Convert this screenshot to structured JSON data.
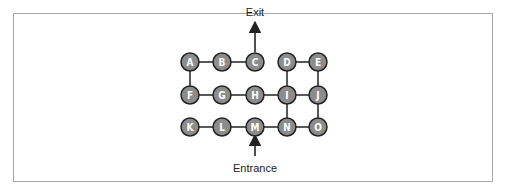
{
  "diagram": {
    "type": "graph-maze",
    "colors": {
      "node_fill": "#8c8c8c",
      "node_stroke": "#222222",
      "edge": "#222222",
      "label": "#ffffff",
      "frame": "#a8a8a8"
    },
    "nodes": [
      {
        "id": "A",
        "label": "A",
        "x": 190,
        "y": 62
      },
      {
        "id": "B",
        "label": "B",
        "x": 222,
        "y": 62
      },
      {
        "id": "C",
        "label": "C",
        "x": 255,
        "y": 62
      },
      {
        "id": "D",
        "label": "D",
        "x": 287,
        "y": 62
      },
      {
        "id": "E",
        "label": "E",
        "x": 318,
        "y": 62
      },
      {
        "id": "F",
        "label": "F",
        "x": 190,
        "y": 95
      },
      {
        "id": "G",
        "label": "G",
        "x": 222,
        "y": 95
      },
      {
        "id": "H",
        "label": "H",
        "x": 255,
        "y": 95
      },
      {
        "id": "I",
        "label": "I",
        "x": 287,
        "y": 95
      },
      {
        "id": "J",
        "label": "J",
        "x": 318,
        "y": 95
      },
      {
        "id": "K",
        "label": "K",
        "x": 190,
        "y": 127
      },
      {
        "id": "L",
        "label": "L",
        "x": 222,
        "y": 127
      },
      {
        "id": "M",
        "label": "M",
        "x": 255,
        "y": 127
      },
      {
        "id": "N",
        "label": "N",
        "x": 287,
        "y": 127
      },
      {
        "id": "O",
        "label": "O",
        "x": 318,
        "y": 127
      }
    ],
    "edges": [
      [
        "A",
        "B"
      ],
      [
        "B",
        "C"
      ],
      [
        "D",
        "E"
      ],
      [
        "A",
        "F"
      ],
      [
        "D",
        "I"
      ],
      [
        "E",
        "J"
      ],
      [
        "F",
        "G"
      ],
      [
        "G",
        "H"
      ],
      [
        "H",
        "I"
      ],
      [
        "I",
        "J"
      ],
      [
        "I",
        "N"
      ],
      [
        "J",
        "O"
      ],
      [
        "K",
        "L"
      ],
      [
        "L",
        "M"
      ],
      [
        "M",
        "N"
      ],
      [
        "N",
        "O"
      ]
    ],
    "exit": {
      "label": "Exit",
      "node": "C"
    },
    "entrance": {
      "label": "Entrance",
      "node": "M"
    }
  }
}
